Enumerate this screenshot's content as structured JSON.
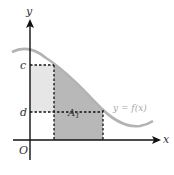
{
  "figure": {
    "axes": {
      "x_label": "x",
      "y_label": "y",
      "origin_label": "O"
    },
    "levels": {
      "c_label": "c",
      "d_label": "d"
    },
    "region_label": "A",
    "region_subscript": "1",
    "curve_label": "y = f(x)",
    "colors": {
      "axis": "#111111",
      "curve": "#b3b3b3",
      "shade_dark": "#b8b8b8",
      "shade_light": "#e6e6e6",
      "dashed": "#111111",
      "curve_label": "#a8a8a8"
    }
  }
}
